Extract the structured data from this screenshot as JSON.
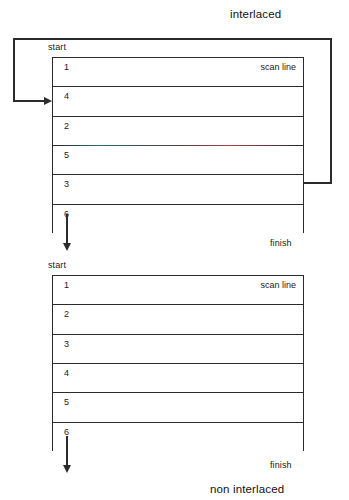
{
  "diagram": {
    "interlaced": {
      "title": "interlaced",
      "start_label": "start",
      "finish_label": "finish",
      "scan_line_label": "scan line",
      "rows": [
        {
          "number": "1"
        },
        {
          "number": "4"
        },
        {
          "number": "2"
        },
        {
          "number": "5"
        },
        {
          "number": "3"
        },
        {
          "number": "6"
        }
      ]
    },
    "non_interlaced": {
      "title": "non interlaced",
      "start_label": "start",
      "finish_label": "finish",
      "scan_line_label": "scan line",
      "rows": [
        {
          "number": "1"
        },
        {
          "number": "2"
        },
        {
          "number": "3"
        },
        {
          "number": "4"
        },
        {
          "number": "5"
        },
        {
          "number": "6"
        }
      ]
    }
  },
  "colors": {
    "line": "#2b2b2b",
    "text": "#1a1a1a",
    "background": "#ffffff",
    "artifact_teal": "#28787d",
    "artifact_red": "#be4646"
  }
}
